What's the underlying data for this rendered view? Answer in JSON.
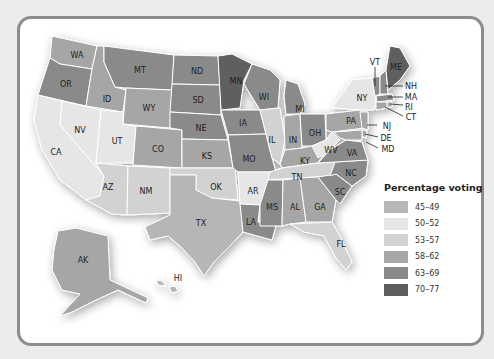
{
  "legend": {
    "title": "Percentage voting",
    "items": [
      {
        "label": "45–49",
        "color": "#b6b6b6"
      },
      {
        "label": "50–52",
        "color": "#e6e6e6"
      },
      {
        "label": "53–57",
        "color": "#d2d2d2"
      },
      {
        "label": "58–62",
        "color": "#a6a6a6"
      },
      {
        "label": "63–69",
        "color": "#8a8a8a"
      },
      {
        "label": "70–77",
        "color": "#5e5e5e"
      }
    ]
  },
  "states": {
    "WA": "58–62",
    "OR": "63–69",
    "CA": "50–52",
    "NV": "50–52",
    "ID": "58–62",
    "MT": "63–69",
    "WY": "58–62",
    "UT": "50–52",
    "AZ": "53–57",
    "NM": "53–57",
    "CO": "58–62",
    "ND": "63–69",
    "SD": "63–69",
    "NE": "63–69",
    "KS": "58–62",
    "OK": "53–57",
    "TX": "45–49",
    "MN": "70–77",
    "IA": "63–69",
    "MO": "63–69",
    "AR": "50–52",
    "LA": "63–69",
    "WI": "63–69",
    "IL": "53–57",
    "MI": "63–69",
    "IN": "58–62",
    "OH": "63–69",
    "KY": "58–62",
    "TN": "53–57",
    "MS": "63–69",
    "AL": "58–62",
    "GA": "58–62",
    "FL": "53–57",
    "SC": "63–69",
    "NC": "63–69",
    "VA": "63–69",
    "WV": "50–52",
    "PA": "58–62",
    "NY": "50–52",
    "VT": "63–69",
    "NH": "63–69",
    "ME": "70–77",
    "MA": "63–69",
    "RI": "58–62",
    "CT": "58–62",
    "NJ": "58–62",
    "DE": "58–62",
    "MD": "58–62",
    "AK": "58–62",
    "HI": "45–49"
  },
  "labels": [
    "WA",
    "OR",
    "CA",
    "NV",
    "ID",
    "MT",
    "WY",
    "UT",
    "AZ",
    "NM",
    "CO",
    "ND",
    "SD",
    "NE",
    "KS",
    "OK",
    "TX",
    "MN",
    "IA",
    "MO",
    "AR",
    "LA",
    "WI",
    "IL",
    "MI",
    "IN",
    "OH",
    "KY",
    "TN",
    "MS",
    "AL",
    "GA",
    "FL",
    "SC",
    "NC",
    "VA",
    "WV",
    "PA",
    "NY",
    "VT",
    "ME",
    "NH",
    "MA",
    "RI",
    "CT",
    "NJ",
    "DE",
    "MD",
    "AK",
    "HI"
  ]
}
